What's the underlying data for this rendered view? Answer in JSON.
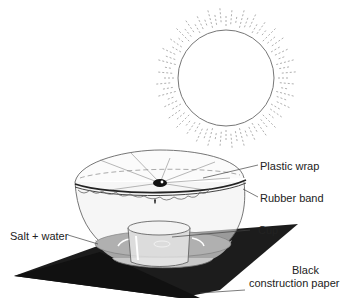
{
  "diagram": {
    "components": [
      {
        "id": "sun",
        "name": "sun-icon"
      },
      {
        "id": "bowl",
        "name": "glass bowl"
      },
      {
        "id": "cup",
        "name": "cup"
      },
      {
        "id": "paper",
        "name": "black construction paper"
      }
    ]
  },
  "labels": {
    "plastic_wrap": "Plastic wrap",
    "rubber_band": "Rubber band",
    "cup": "Cup",
    "salt_water": "Salt + water",
    "black": "Black",
    "construction_paper": "construction paper"
  },
  "colors": {
    "paper": "#1a1a1a",
    "water": "#9a9a9a",
    "outline": "#555555",
    "sun_ray": "#999999"
  }
}
